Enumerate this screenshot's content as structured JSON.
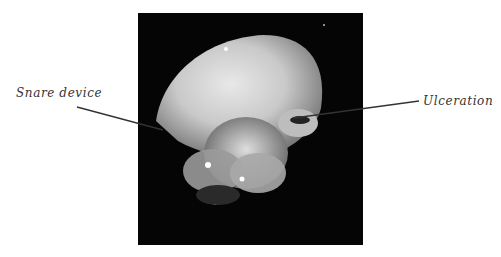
{
  "figure": {
    "labels": {
      "snare": "Snare device",
      "ulceration": "Ulceration"
    },
    "colors": {
      "background": "#ffffff",
      "panel": "#050505",
      "label_text": "#333333"
    }
  }
}
